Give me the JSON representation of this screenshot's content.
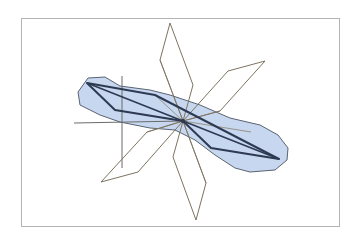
{
  "figure": {
    "width": 359,
    "height": 244,
    "frame": {
      "x": 21,
      "y": 18,
      "width": 318,
      "height": 208,
      "stroke": "#b4b4b4"
    },
    "center": {
      "x": 183,
      "y": 121
    },
    "colors": {
      "blob_fill": "#c6d7ef",
      "blob_stroke": "#5a6472",
      "dark_quad": "#2d3a52",
      "petal_stroke": "#7d7460",
      "axis_stroke": "#6b6b6b",
      "ray_stroke": "#8a8270"
    },
    "blob_points": "120,86 150,90 170,95 200,105 230,118 260,125 278,135 288,148 287,160 275,170 250,172 235,168 215,155 195,140 175,130 150,128 120,122 100,115 80,105 78,92 88,78 105,77",
    "dark_quad_points": "87,83 155,95 279,159 211,148 183,121 115,110",
    "dark_center_line": "87,83 183,121 279,159",
    "petals": [
      {
        "name": "top",
        "points": "170,23 160,60 183,121 193,85"
      },
      {
        "name": "upper-right",
        "points": "265,61 228,71 183,121 220,111"
      },
      {
        "name": "lower-left",
        "points": "101,182 138,172 183,121 147,132"
      },
      {
        "name": "bottom",
        "points": "196,220 206,183 183,121 173,157"
      }
    ],
    "axis_lines": [
      {
        "name": "horizontal-axis-line",
        "x1": 74,
        "y1": 123,
        "x2": 183,
        "y2": 121
      },
      {
        "name": "vertical-axis-line",
        "x1": 122,
        "y1": 76,
        "x2": 122,
        "y2": 168
      }
    ],
    "rays": [
      {
        "x2": 115,
        "y2": 110
      },
      {
        "x2": 155,
        "y2": 95
      },
      {
        "x2": 211,
        "y2": 148
      },
      {
        "x2": 251,
        "y2": 132
      },
      {
        "x2": 160,
        "y2": 60
      },
      {
        "x2": 206,
        "y2": 183
      },
      {
        "x2": 147,
        "y2": 132
      },
      {
        "x2": 220,
        "y2": 111
      }
    ]
  }
}
